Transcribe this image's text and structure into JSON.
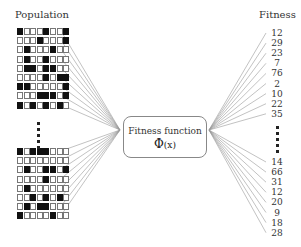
{
  "population_label": "Population",
  "fitness_label": "Fitness",
  "function_box": {
    "title": "Fitness function",
    "symbol": "Φ",
    "arg": "(x)"
  },
  "population_top": [
    [
      1,
      0,
      0,
      0,
      1,
      0,
      0,
      1
    ],
    [
      0,
      0,
      0,
      1,
      0,
      0,
      0,
      1
    ],
    [
      0,
      1,
      0,
      0,
      0,
      1,
      0,
      0
    ],
    [
      0,
      1,
      0,
      0,
      1,
      0,
      0,
      0
    ],
    [
      0,
      1,
      1,
      0,
      1,
      1,
      0,
      0
    ],
    [
      0,
      0,
      0,
      0,
      1,
      0,
      1,
      1
    ],
    [
      1,
      1,
      0,
      0,
      0,
      0,
      0,
      1
    ],
    [
      0,
      0,
      0,
      1,
      1,
      1,
      0,
      1
    ],
    [
      1,
      0,
      1,
      0,
      1,
      0,
      1,
      0
    ]
  ],
  "population_bottom": [
    [
      1,
      0,
      1,
      1,
      1,
      0,
      0,
      0
    ],
    [
      0,
      0,
      0,
      0,
      0,
      0,
      0,
      0
    ],
    [
      0,
      1,
      0,
      0,
      1,
      1,
      0,
      1
    ],
    [
      0,
      0,
      0,
      0,
      1,
      0,
      0,
      0
    ],
    [
      0,
      1,
      0,
      0,
      0,
      0,
      0,
      0
    ],
    [
      0,
      0,
      1,
      0,
      1,
      0,
      1,
      0
    ],
    [
      0,
      1,
      0,
      1,
      1,
      0,
      0,
      0
    ],
    [
      1,
      0,
      0,
      0,
      0,
      1,
      0,
      0
    ]
  ],
  "fitness_top": [
    "12",
    "29",
    "23",
    "7",
    "76",
    "2",
    "10",
    "22",
    "35"
  ],
  "fitness_bottom": [
    "14",
    "66",
    "31",
    "12",
    "20",
    "9",
    "18",
    "28"
  ],
  "colors": {
    "cell_on": "#111111",
    "cell_border": "#777777",
    "line": "#999999"
  }
}
